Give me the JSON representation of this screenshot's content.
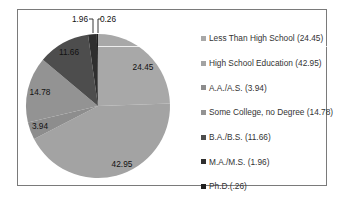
{
  "chart_data": {
    "type": "pie",
    "title": "",
    "legend_position": "right",
    "categories": [
      "Less Than High School",
      "High School Education",
      "A.A./A.S.",
      "Some College, no Degree",
      "B.A./B.S.",
      "M.A./M.S.",
      "Ph.D."
    ],
    "values": [
      24.45,
      42.95,
      3.94,
      14.78,
      11.66,
      1.96,
      0.26
    ],
    "colors": [
      "#a8a8a8",
      "#a3a3a3",
      "#8d8d8d",
      "#939393",
      "#4d4d4d",
      "#2f2f2f",
      "#1f1f1f"
    ],
    "data_labels": [
      "24.45",
      "42.95",
      "3.94",
      "14.78",
      "11.66",
      "1.96",
      "0.26"
    ],
    "legend": [
      "Less Than High School (24.45)",
      "High School Education (42.95)",
      "A.A./A.S. (3.94)",
      "Some College, no Degree (14.78)",
      "B.A./B.S. (11.66)",
      "M.A./M.S. (1.96)",
      "Ph.D.(.26)"
    ]
  }
}
